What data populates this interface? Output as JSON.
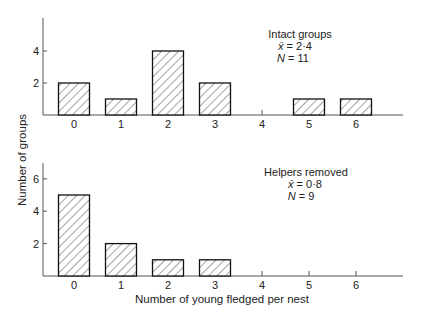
{
  "chart_data": [
    {
      "type": "bar",
      "title": "Intact groups",
      "annotation": {
        "title": "Intact groups",
        "mean_label": "x̄ = 2·4",
        "n_label": "N = 11",
        "mean": 2.4,
        "n": 11
      },
      "categories": [
        "0",
        "1",
        "2",
        "3",
        "4",
        "5",
        "6"
      ],
      "values": [
        2,
        1,
        4,
        2,
        0,
        1,
        1
      ],
      "xlabel": "Number of young fledged per nest",
      "ylabel": "Number of groups",
      "yticks": [
        2,
        4
      ],
      "ylim": [
        0,
        6
      ],
      "grid": false,
      "legend": "none"
    },
    {
      "type": "bar",
      "title": "Helpers removed",
      "annotation": {
        "title": "Helpers removed",
        "mean_label": "x̄ = 0·8",
        "n_label": "N = 9",
        "mean": 0.8,
        "n": 9
      },
      "categories": [
        "0",
        "1",
        "2",
        "3",
        "4",
        "5",
        "6"
      ],
      "values": [
        5,
        2,
        1,
        1,
        0,
        0,
        0
      ],
      "xlabel": "Number of young fledged per nest",
      "ylabel": "Number of groups",
      "yticks": [
        2,
        4,
        6
      ],
      "ylim": [
        0,
        7
      ],
      "grid": false,
      "legend": "none"
    }
  ],
  "labels": {
    "ylabel": "Number of groups",
    "xlabel": "Number of young fledged per nest",
    "top_title": "Intact groups",
    "top_mean_sym": "x̄",
    "top_mean_val": " = 2·4",
    "top_n_sym": "N",
    "top_n_val": " = 11",
    "bottom_title": "Helpers removed",
    "bottom_mean_sym": "x̄",
    "bottom_mean_val": " = 0·8",
    "bottom_n_sym": "N",
    "bottom_n_val": " = 9"
  },
  "colors": {
    "bar_stroke": "#111111",
    "hatch": "#333333",
    "axis": "#555555",
    "background": "#ffffff"
  }
}
